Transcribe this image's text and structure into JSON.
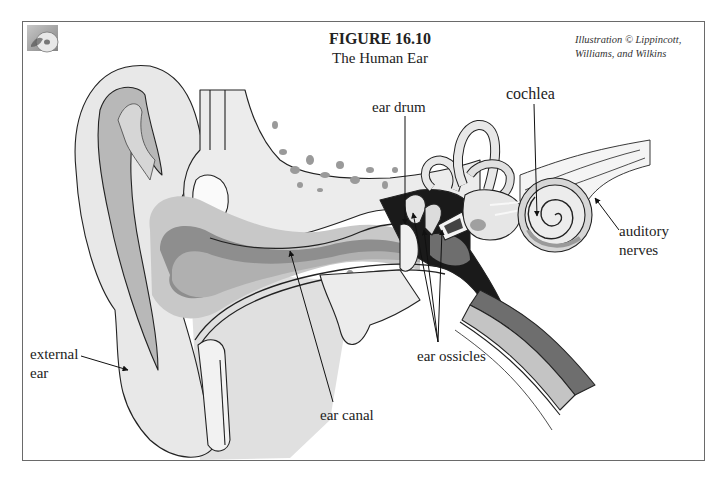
{
  "figure": {
    "title": "FIGURE 16.10",
    "subtitle": "The Human Ear",
    "credit_line1": "Illustration © Lippincott,",
    "credit_line2": "Williams, and Wilkins",
    "icon": "cd-disc-icon"
  },
  "labels": {
    "ear_drum": "ear drum",
    "cochlea": "cochlea",
    "auditory_nerves_line1": "auditory",
    "auditory_nerves_line2": "nerves",
    "external_ear_line1": "external",
    "external_ear_line2": "ear",
    "ear_canal": "ear canal",
    "ear_ossicles": "ear ossicles"
  },
  "colors": {
    "background": "#ffffff",
    "frame": "#6a6a6a",
    "light_tissue": "#e6e6e6",
    "mid_gray": "#b4b4b4",
    "dark_gray": "#6e6e6e",
    "cavity": "#1a1a1a",
    "bone_spots": "#9a9a9a"
  }
}
